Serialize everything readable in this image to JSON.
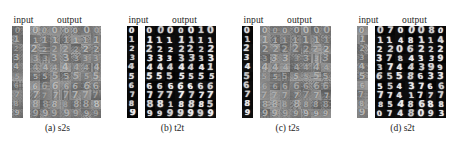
{
  "figure": {
    "panel_count": 4,
    "column_headers": {
      "input": "input",
      "output": "output"
    },
    "rows": 10,
    "output_columns": 7,
    "row_digits": [
      "0",
      "1",
      "2",
      "3",
      "4",
      "5",
      "6",
      "7",
      "8",
      "9"
    ],
    "colors": {
      "page_background": "#ffffff",
      "mnist_background": "#060606",
      "mnist_foreground": "#f2f2f2",
      "svhn_background": "#8b8b8b",
      "svhn_foreground": "#f5f5f5",
      "text": "#1d1d1d"
    }
  },
  "panels": [
    {
      "id": "s2s",
      "caption": "(a) s2s",
      "header_input": "input",
      "header_output": "output",
      "input_style": "svhn",
      "output_style": "svhn",
      "input_digits": [
        "0",
        "1",
        "2",
        "3",
        "4",
        "5",
        "6",
        "7",
        "8",
        "9"
      ],
      "output_digits": [
        [
          "0",
          "0",
          "0",
          "0",
          "0",
          "0",
          "0"
        ],
        [
          "1",
          "1",
          "1",
          "1",
          "1",
          "1",
          "1"
        ],
        [
          "2",
          "2",
          "2",
          "2",
          "2",
          "2",
          "2"
        ],
        [
          "3",
          "3",
          "3",
          "3",
          "3",
          "3",
          "3"
        ],
        [
          "4",
          "4",
          "4",
          "4",
          "4",
          "4",
          "4"
        ],
        [
          "5",
          "5",
          "5",
          "5",
          "5",
          "5",
          "5"
        ],
        [
          "6",
          "6",
          "6",
          "6",
          "6",
          "6",
          "6"
        ],
        [
          "7",
          "7",
          "7",
          "7",
          "7",
          "7",
          "7"
        ],
        [
          "8",
          "8",
          "8",
          "8",
          "8",
          "8",
          "8"
        ],
        [
          "9",
          "9",
          "9",
          "9",
          "9",
          "9",
          "9"
        ]
      ]
    },
    {
      "id": "t2t",
      "caption": "(b) t2t",
      "header_input": "input",
      "header_output": "output",
      "input_style": "mnist",
      "output_style": "mnist",
      "input_digits": [
        "0",
        "1",
        "2",
        "3",
        "4",
        "5",
        "6",
        "7",
        "8",
        "9"
      ],
      "output_digits": [
        [
          "0",
          "0",
          "0",
          "0",
          "0",
          "1",
          "0"
        ],
        [
          "1",
          "1",
          "1",
          "1",
          "1",
          "1",
          "1"
        ],
        [
          "2",
          "2",
          "2",
          "2",
          "2",
          "2",
          "2"
        ],
        [
          "3",
          "3",
          "3",
          "3",
          "3",
          "3",
          "3"
        ],
        [
          "4",
          "4",
          "4",
          "4",
          "4",
          "4",
          "1"
        ],
        [
          "5",
          "5",
          "5",
          "5",
          "5",
          "5",
          "5"
        ],
        [
          "6",
          "6",
          "6",
          "6",
          "6",
          "6",
          "6"
        ],
        [
          "7",
          "7",
          "7",
          "7",
          "7",
          "7",
          "7"
        ],
        [
          "8",
          "8",
          "1",
          "8",
          "8",
          "8",
          "5"
        ],
        [
          "9",
          "9",
          "9",
          "9",
          "9",
          "9",
          "9"
        ]
      ]
    },
    {
      "id": "t2s",
      "caption": "(c) t2s",
      "header_input": "input",
      "header_output": "output",
      "input_style": "mnist",
      "output_style": "svhn",
      "input_digits": [
        "0",
        "1",
        "2",
        "3",
        "4",
        "5",
        "6",
        "7",
        "8",
        "9"
      ],
      "output_digits": [
        [
          "0",
          "0",
          "0",
          "0",
          "0",
          "0",
          "0"
        ],
        [
          "1",
          "1",
          "1",
          "1",
          "1",
          "1",
          "1"
        ],
        [
          "2",
          "2",
          "2",
          "2",
          "2",
          "2",
          "2"
        ],
        [
          "3",
          "3",
          "3",
          "3",
          "3",
          "3",
          "3"
        ],
        [
          "4",
          "4",
          "4",
          "4",
          "4",
          "4",
          "4"
        ],
        [
          "5",
          "5",
          "5",
          "5",
          "5",
          "5",
          "5"
        ],
        [
          "6",
          "6",
          "6",
          "6",
          "6",
          "6",
          "6"
        ],
        [
          "7",
          "7",
          "7",
          "7",
          "7",
          "7",
          "7"
        ],
        [
          "8",
          "8",
          "8",
          "8",
          "8",
          "8",
          "8"
        ],
        [
          "9",
          "9",
          "9",
          "9",
          "9",
          "9",
          "9"
        ]
      ]
    },
    {
      "id": "s2t",
      "caption": "(d) s2t",
      "header_input": "input",
      "header_output": "output",
      "input_style": "svhn",
      "output_style": "mnist",
      "input_digits": [
        "0",
        "1",
        "2",
        "3",
        "4",
        "5",
        "6",
        "7",
        "8",
        "9"
      ],
      "output_digits": [
        [
          "0",
          "7",
          "0",
          "0",
          "0",
          "8",
          "0"
        ],
        [
          "1",
          "1",
          "4",
          "8",
          "1",
          "1",
          "4"
        ],
        [
          "2",
          "2",
          "0",
          "6",
          "2",
          "2",
          "2"
        ],
        [
          "3",
          "7",
          "8",
          "4",
          "3",
          "3",
          "9"
        ],
        [
          "3",
          "7",
          "4",
          "4",
          "3",
          "9",
          "9"
        ],
        [
          "6",
          "5",
          "5",
          "8",
          "6",
          "3",
          "3"
        ],
        [
          "5",
          "5",
          "4",
          "3",
          "7",
          "6",
          "6"
        ],
        [
          "7",
          "7",
          "4",
          "1",
          "7",
          "7",
          "7"
        ],
        [
          "8",
          "5",
          "4",
          "8",
          "6",
          "8",
          "8"
        ],
        [
          "0",
          "7",
          "4",
          "8",
          "0",
          "9",
          "3"
        ]
      ]
    }
  ]
}
